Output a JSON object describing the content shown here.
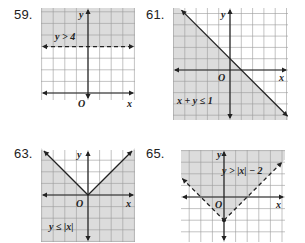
{
  "exercises": [
    {
      "number": "59.",
      "inequality": "y > 4",
      "boundary": "dashed",
      "shade": "above",
      "axis_x_label": "x",
      "axis_y_label": "y",
      "origin_label": "O",
      "xrange": [
        -4,
        4
      ],
      "yrange": [
        -1,
        7
      ]
    },
    {
      "number": "61.",
      "inequality": "x + y ≤ 1",
      "boundary": "solid",
      "shade": "below",
      "axis_x_label": "x",
      "axis_y_label": "y",
      "origin_label": "O",
      "xrange": [
        -5,
        5
      ],
      "yrange": [
        -5,
        5
      ]
    },
    {
      "number": "63.",
      "inequality": "y ≤ |x|",
      "boundary": "solid",
      "shade": "below",
      "axis_x_label": "x",
      "axis_y_label": "y",
      "origin_label": "O",
      "xrange": [
        -4,
        4
      ],
      "yrange": [
        -4,
        4
      ]
    },
    {
      "number": "65.",
      "inequality": "y > |x| − 2",
      "boundary": "dashed",
      "shade": "above",
      "axis_x_label": "x",
      "axis_y_label": "y",
      "origin_label": "O",
      "xrange": [
        -4,
        4
      ],
      "yrange": [
        -4,
        4
      ]
    }
  ],
  "colors": {
    "shade": "#dcdcdc",
    "grid": "#9a9a9a",
    "axis": "#222222"
  }
}
